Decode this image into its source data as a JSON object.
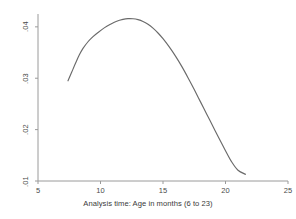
{
  "chart_data": {
    "type": "line",
    "title": "",
    "xlabel": "Analysis time: Age in months (6 to 23)",
    "ylabel": "",
    "xlim": [
      5,
      25
    ],
    "ylim": [
      0.01,
      0.0425
    ],
    "grid": false,
    "legend": null,
    "xticks": [
      5,
      10,
      15,
      20,
      25
    ],
    "xtick_labels": [
      "5",
      "10",
      "15",
      "20",
      "25"
    ],
    "yticks": [
      0.01,
      0.02,
      0.03,
      0.04
    ],
    "ytick_labels": [
      ".01",
      ".02",
      ".03",
      ".04"
    ],
    "line_color": "#6a6a6a",
    "axis_color": "#9a9a9a",
    "series": [
      {
        "name": "smoothed hazard",
        "x": [
          7.4,
          7.7,
          8.0,
          8.3,
          8.6,
          9.0,
          9.4,
          9.8,
          10.3,
          10.8,
          11.3,
          11.8,
          12.2,
          12.6,
          13.0,
          13.4,
          13.8,
          14.2,
          14.6,
          15.0,
          15.5,
          16.0,
          16.5,
          17.0,
          17.5,
          18.0,
          18.5,
          19.0,
          19.5,
          20.0,
          20.5,
          21.0,
          21.6
        ],
        "y": [
          0.0295,
          0.0312,
          0.0329,
          0.0345,
          0.0358,
          0.0371,
          0.0381,
          0.0389,
          0.0398,
          0.0405,
          0.0411,
          0.04145,
          0.0416,
          0.04158,
          0.0414,
          0.04105,
          0.0405,
          0.03975,
          0.0388,
          0.0377,
          0.0361,
          0.0343,
          0.0323,
          0.0301,
          0.0278,
          0.0254,
          0.023,
          0.0206,
          0.0182,
          0.0159,
          0.0137,
          0.0121,
          0.0113
        ]
      }
    ],
    "annotations": {
      "peak_x": 12.6,
      "peak_y": 0.0416,
      "start_x": 7.4,
      "start_y": 0.0295,
      "end_x": 21.6,
      "end_y": 0.0113
    }
  }
}
